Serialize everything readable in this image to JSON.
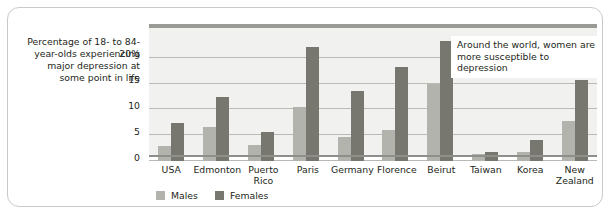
{
  "figure": {
    "axis_caption": "Percentage of 18- to 84-year-olds experiencing major depression at some point in life",
    "annotation": "Around the world, women are more susceptible to depression"
  },
  "colors": {
    "male_bar": "#b3b3ae",
    "female_bar": "#77776f",
    "plot_background": "#f1f1ef",
    "gridline": "#b9b9b5",
    "frame": "#c9c9c9",
    "text": "#231f20"
  },
  "chart_data": {
    "type": "bar",
    "title": "",
    "subtitle": "",
    "xlabel": "",
    "ylabel": "Percentage of 18- to 84-year-olds experiencing major depression at some point in life",
    "ylim": [
      0,
      25
    ],
    "yticks": [
      0,
      5,
      10,
      15,
      20
    ],
    "ytick_labels": [
      "0",
      "5",
      "10",
      "15",
      "20%"
    ],
    "grid": true,
    "legend_position": "bottom-left",
    "categories": [
      "USA",
      "Edmonton",
      "Puerto Rico",
      "Paris",
      "Germany",
      "Florence",
      "Beirut",
      "Taiwan",
      "Korea",
      "New Zealand"
    ],
    "series": [
      {
        "name": "Males",
        "color": "#b3b3ae",
        "values": [
          2.9,
          6.6,
          3.2,
          10.5,
          4.6,
          6.1,
          14.9,
          1.3,
          1.8,
          7.7
        ]
      },
      {
        "name": "Females",
        "color": "#77776f",
        "values": [
          7.4,
          12.4,
          5.6,
          22.0,
          13.6,
          18.3,
          23.3,
          1.8,
          4.0,
          15.7
        ]
      }
    ],
    "annotations": [
      {
        "text": "Around the world, women are more susceptible to depression",
        "x": "Beirut/Taiwan",
        "y": 21
      }
    ]
  }
}
